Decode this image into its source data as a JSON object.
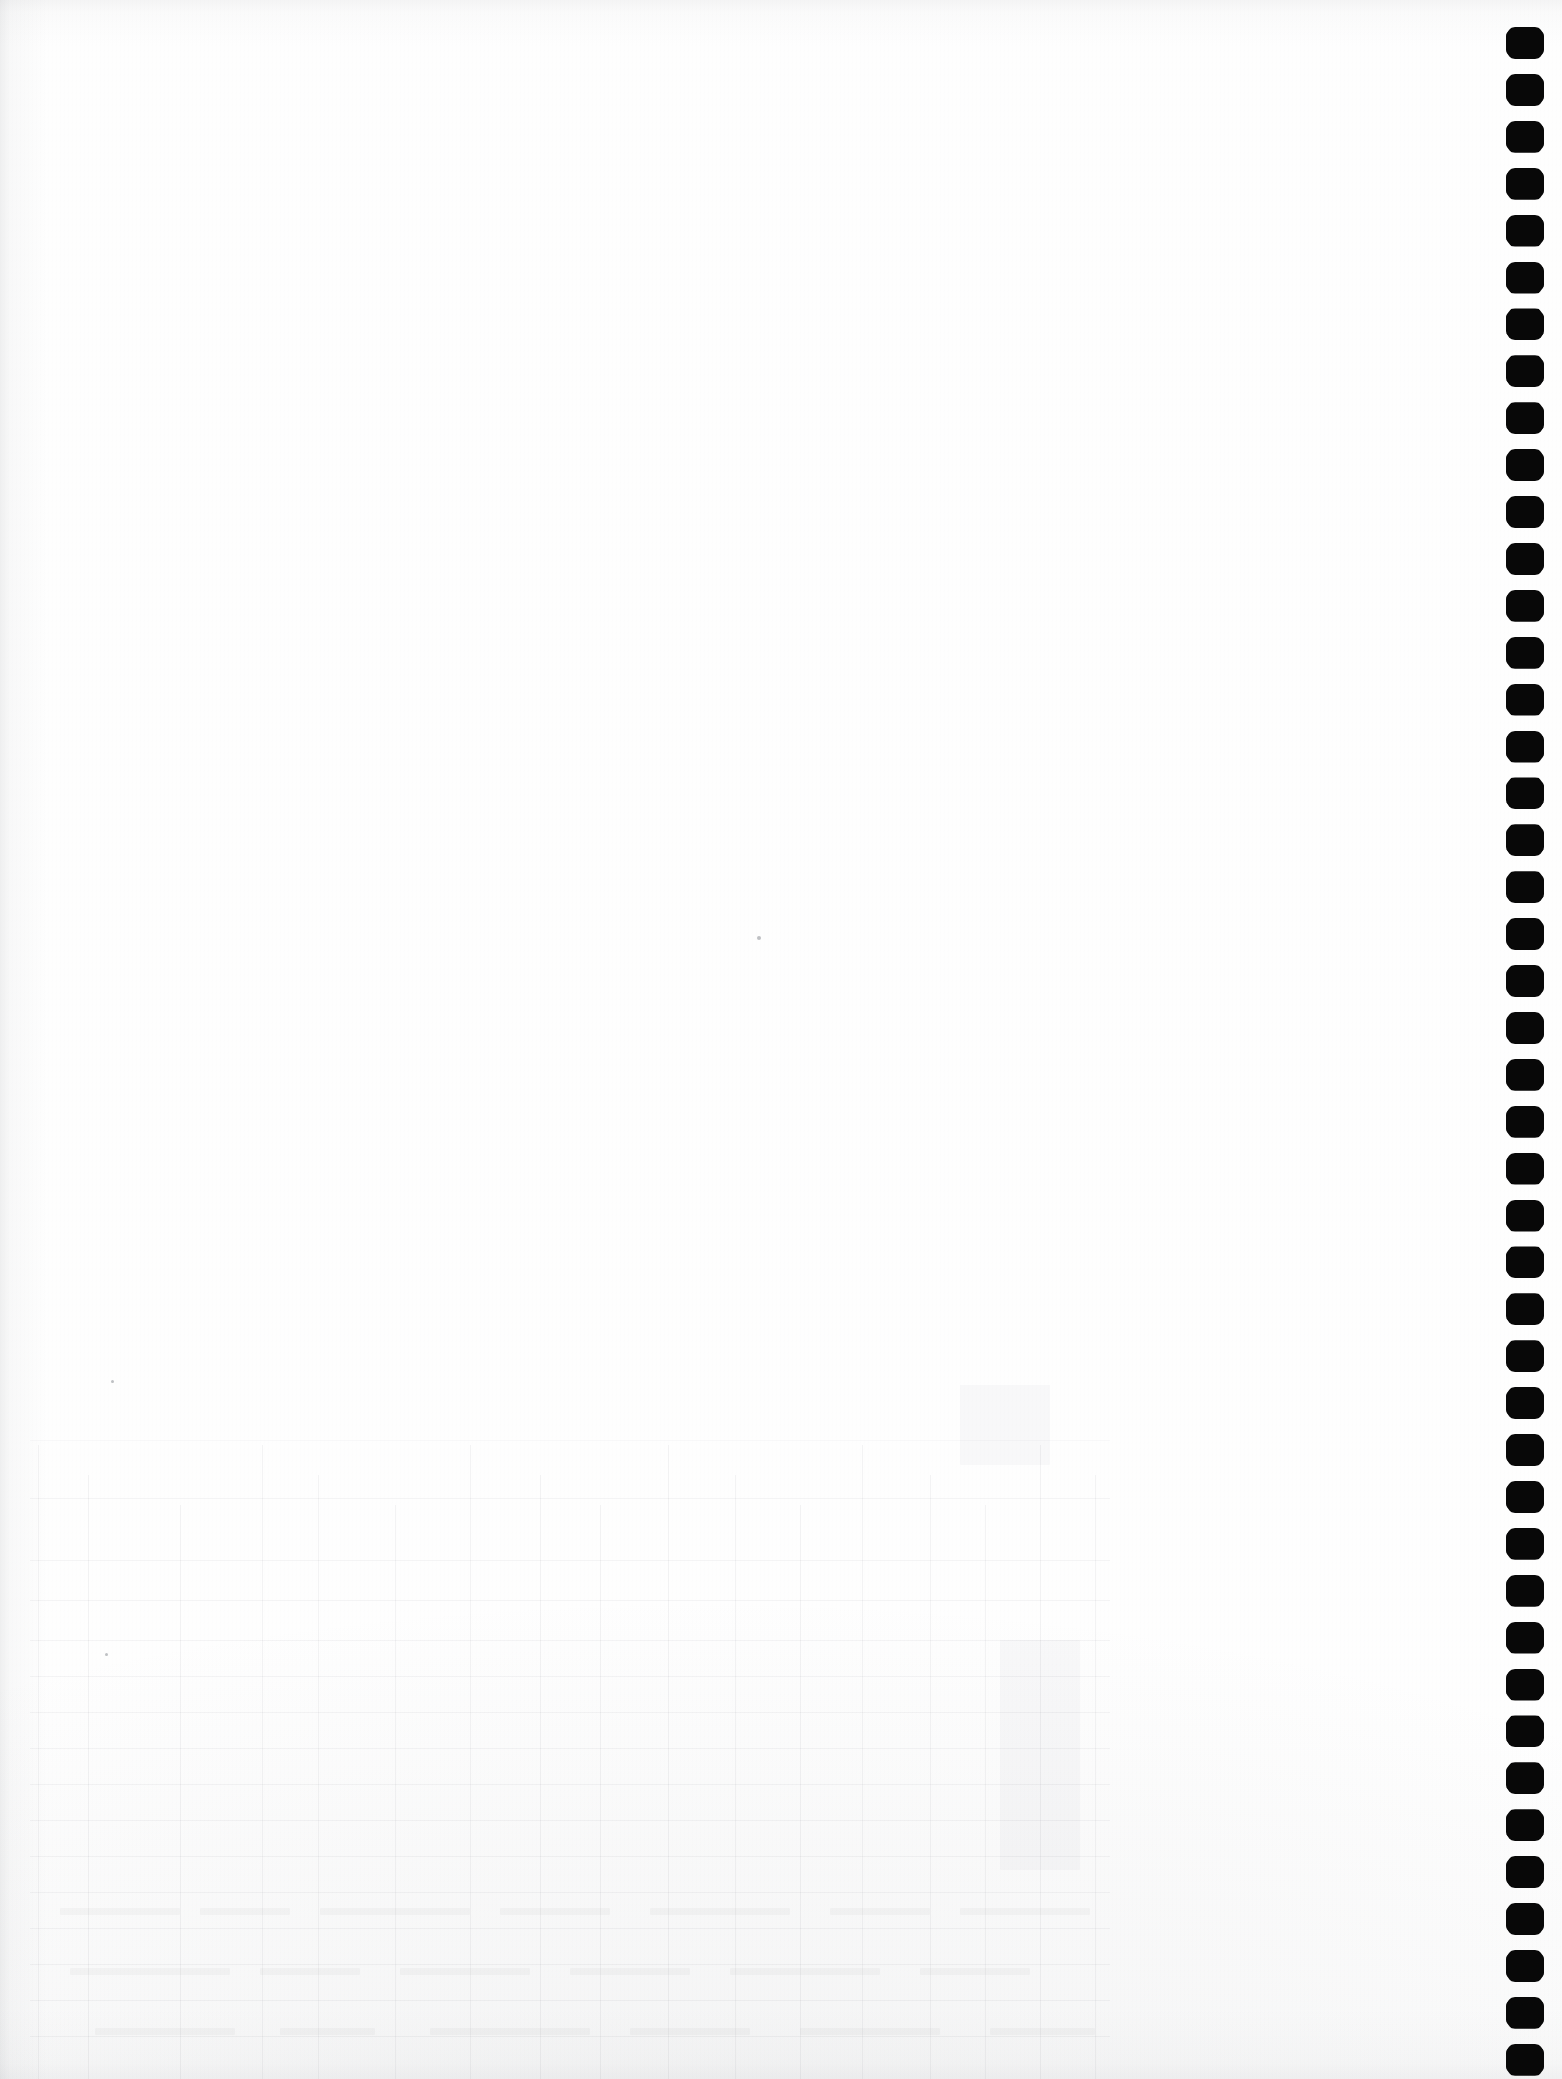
{
  "document": {
    "page_kind": "scanned-blank-page",
    "page_title": "",
    "visible_text": "",
    "note": ""
  },
  "canvas": {
    "width": 1562,
    "height": 2079,
    "paper_color": "#fefefe",
    "background_color": "#ffffff"
  },
  "binding": {
    "name": "comb-binding-holes",
    "ink_color": "#080808",
    "count": 44,
    "first_center_y": 43,
    "spacing": 46.9,
    "hole_width": 38,
    "hole_height": 32,
    "column_left": 1510
  },
  "bleed_through": {
    "name": "reverse-side-table",
    "description": "",
    "ink_color": "#6c7078",
    "region": {
      "top": 1385,
      "height": 694
    },
    "column_x": [
      38,
      88,
      180,
      262,
      318,
      395,
      470,
      540,
      600,
      668,
      735,
      800,
      862,
      930,
      985,
      1040,
      1095
    ],
    "row_y": [
      1498,
      1560,
      1600,
      1640,
      1676,
      1712,
      1748,
      1784,
      1820,
      1856,
      1892,
      1928,
      1964,
      2000,
      2036
    ],
    "text_runs": [
      {
        "x": 60,
        "y": 1908,
        "w": 120
      },
      {
        "x": 200,
        "y": 1908,
        "w": 90
      },
      {
        "x": 320,
        "y": 1908,
        "w": 150
      },
      {
        "x": 500,
        "y": 1908,
        "w": 110
      },
      {
        "x": 650,
        "y": 1908,
        "w": 140
      },
      {
        "x": 830,
        "y": 1908,
        "w": 100
      },
      {
        "x": 960,
        "y": 1908,
        "w": 130
      },
      {
        "x": 70,
        "y": 1968,
        "w": 160
      },
      {
        "x": 260,
        "y": 1968,
        "w": 100
      },
      {
        "x": 400,
        "y": 1968,
        "w": 130
      },
      {
        "x": 570,
        "y": 1968,
        "w": 120
      },
      {
        "x": 730,
        "y": 1968,
        "w": 150
      },
      {
        "x": 920,
        "y": 1968,
        "w": 110
      },
      {
        "x": 95,
        "y": 2028,
        "w": 140
      },
      {
        "x": 280,
        "y": 2028,
        "w": 95
      },
      {
        "x": 430,
        "y": 2028,
        "w": 160
      },
      {
        "x": 630,
        "y": 2028,
        "w": 120
      },
      {
        "x": 800,
        "y": 2028,
        "w": 140
      },
      {
        "x": 990,
        "y": 2028,
        "w": 105
      }
    ],
    "blocks": [
      {
        "x": 30,
        "y": 1440,
        "w": 1080,
        "h": 1
      },
      {
        "x": 960,
        "y": 1345,
        "w": 90,
        "h": 120
      },
      {
        "x": 1000,
        "y": 1640,
        "w": 80,
        "h": 230
      }
    ]
  },
  "artifacts": {
    "specks": [
      {
        "x": 757,
        "y": 936,
        "size": 4
      },
      {
        "x": 111,
        "y": 1380,
        "size": 3
      },
      {
        "x": 105,
        "y": 1653,
        "size": 3
      }
    ]
  }
}
